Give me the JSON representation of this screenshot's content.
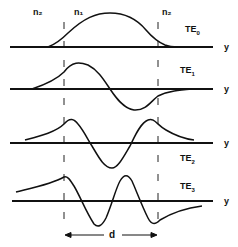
{
  "regions": {
    "left_cladding": "n₂",
    "core": "n₁",
    "right_cladding": "n₂"
  },
  "axis_label": "y",
  "width_label": "d",
  "modes": [
    {
      "label": "TE",
      "sub": "0"
    },
    {
      "label": "TE",
      "sub": "1"
    },
    {
      "label": "TE",
      "sub": "2"
    },
    {
      "label": "TE",
      "sub": "3"
    }
  ],
  "colors": {
    "line": "#111111",
    "background": "#ffffff"
  }
}
